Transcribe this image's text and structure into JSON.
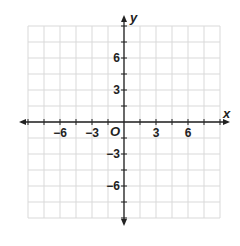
{
  "diagram": {
    "type": "coordinate-plane",
    "x_axis_label": "x",
    "y_axis_label": "y",
    "origin_label": "O",
    "x_range": [
      -9,
      9
    ],
    "y_range": [
      -9,
      9
    ],
    "grid_step": 1.5,
    "x_tick_labels": [
      {
        "value": -6,
        "text": "−6"
      },
      {
        "value": -3,
        "text": "−3"
      },
      {
        "value": 3,
        "text": "3"
      },
      {
        "value": 6,
        "text": "6"
      }
    ],
    "y_tick_labels": [
      {
        "value": 6,
        "text": "6"
      },
      {
        "value": 3,
        "text": "3"
      },
      {
        "value": -3,
        "text": "−3"
      },
      {
        "value": -6,
        "text": "−6"
      }
    ],
    "colors": {
      "grid": "#d9d9d9",
      "axis": "#222222",
      "background": "#ffffff"
    }
  }
}
